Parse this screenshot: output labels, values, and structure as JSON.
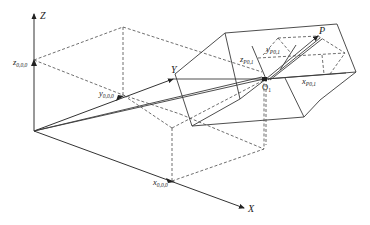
{
  "figure": {
    "type": "3d-coordinate-geometry-diagram",
    "axes": {
      "x": {
        "label": "X"
      },
      "y": {
        "label": "Y"
      },
      "z": {
        "label": "Z"
      }
    },
    "origin_ticks": {
      "x": {
        "base": "x",
        "sub": "0,0,0"
      },
      "y": {
        "base": "y",
        "sub": "0,0,0"
      },
      "z": {
        "base": "z",
        "sub": "0,0,0"
      }
    },
    "local_frame": {
      "origin_label": {
        "base": "O",
        "sub": "1"
      },
      "point_label": "P",
      "components": {
        "x": {
          "base": "x",
          "sub": "P0,1"
        },
        "y": {
          "base": "y",
          "sub": "P0,1"
        },
        "z": {
          "base": "z",
          "sub": "P0,1"
        }
      }
    },
    "colors": {
      "line": "#3a3a3a",
      "background": "#ffffff"
    }
  }
}
